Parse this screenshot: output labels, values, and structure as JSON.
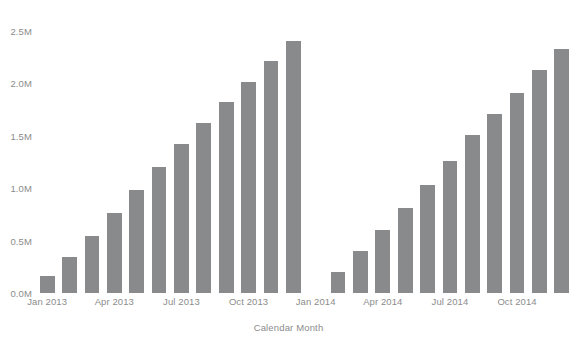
{
  "chart_data": {
    "type": "bar",
    "title": "",
    "subtitle": "",
    "xlabel": "Calendar Month",
    "ylabel": "",
    "grid": false,
    "legend": null,
    "bar_color": "#888a8c",
    "axis_text_color": "#8c8c8c",
    "background": "#ffffff",
    "ylim": [
      0,
      2700000
    ],
    "ytick_values": [
      0,
      500000,
      1000000,
      1500000,
      2000000,
      2500000
    ],
    "ytick_labels": [
      "0.0M",
      "0.5M",
      "1.0M",
      "1.5M",
      "2.0M",
      "2.5M"
    ],
    "xtick_labels": [
      "Jan 2013",
      "Apr 2013",
      "Jul 2013",
      "Oct 2013",
      "Jan 2014",
      "Apr 2014",
      "Jul 2014",
      "Oct 2014"
    ],
    "xtick_categories": [
      "Jan 2013",
      "Apr 2013",
      "Jul 2013",
      "Oct 2013",
      "Jan 2014",
      "Apr 2014",
      "Jul 2014",
      "Oct 2014"
    ],
    "categories": [
      "Jan 2013",
      "Feb 2013",
      "Mar 2013",
      "Apr 2013",
      "May 2013",
      "Jun 2013",
      "Jul 2013",
      "Aug 2013",
      "Sep 2013",
      "Oct 2013",
      "Nov 2013",
      "Dec 2013",
      "Jan 2014",
      "Feb 2014",
      "Mar 2014",
      "Apr 2014",
      "May 2014",
      "Jun 2014",
      "Jul 2014",
      "Aug 2014",
      "Sep 2014",
      "Oct 2014",
      "Nov 2014",
      "Dec 2014"
    ],
    "values": [
      0.16,
      0.34,
      0.54,
      0.76,
      0.98,
      1.2,
      1.42,
      1.62,
      1.82,
      2.01,
      2.21,
      2.4,
      null,
      0.2,
      0.4,
      0.6,
      0.81,
      1.03,
      1.26,
      1.51,
      1.71,
      1.91,
      2.13,
      2.33
    ],
    "values_note": "values in millions; Jan 2014 has no bar (gap in data)",
    "values_absolute": [
      160000,
      340000,
      540000,
      760000,
      980000,
      1200000,
      1420000,
      1620000,
      1820000,
      2010000,
      2210000,
      2400000,
      null,
      200000,
      400000,
      600000,
      810000,
      1030000,
      1260000,
      1510000,
      1710000,
      1910000,
      2130000,
      2330000
    ]
  }
}
